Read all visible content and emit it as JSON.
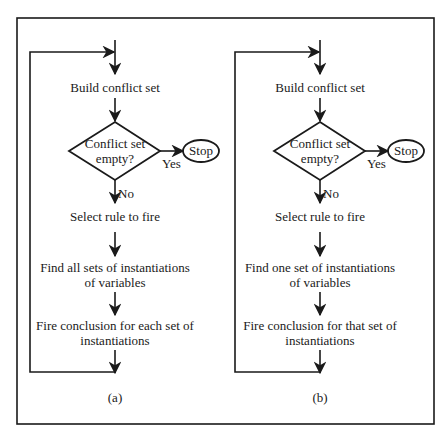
{
  "figure": {
    "panels": [
      {
        "label": "(a)",
        "start_step": "Build conflict set",
        "decision": {
          "line1": "Conflict set",
          "line2": "empty?"
        },
        "yes_label": "Yes",
        "no_label": "No",
        "terminal": "Stop",
        "step_select": "Select rule to fire",
        "step_find": {
          "line1": "Find all sets of instantiations",
          "line2": "of variables"
        },
        "step_fire": {
          "line1": "Fire conclusion for each set of",
          "line2": "instantiations"
        }
      },
      {
        "label": "(b)",
        "start_step": "Build conflict set",
        "decision": {
          "line1": "Conflict set",
          "line2": "empty?"
        },
        "yes_label": "Yes",
        "no_label": "No",
        "terminal": "Stop",
        "step_select": "Select rule to fire",
        "step_find": {
          "line1": "Find one set of instantiations",
          "line2": "of variables"
        },
        "step_fire": {
          "line1": "Fire conclusion for that set of",
          "line2": "instantiations"
        }
      }
    ]
  }
}
